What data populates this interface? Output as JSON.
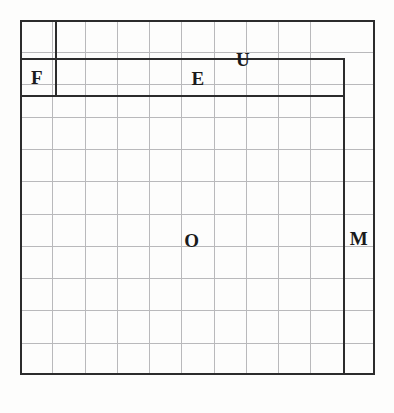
{
  "figure": {
    "type": "nested-region-grid-diagram",
    "background_color": "#fdfdfc",
    "ink_color": "#2c2c2c",
    "grid_color": "#b9b9bb",
    "frame": {
      "x": 20,
      "y": 20,
      "width": 355,
      "height": 355
    },
    "grid": {
      "columns": 11,
      "rows": 11,
      "cell_width": 32.3,
      "cell_height": 32.3
    }
  },
  "regions": [
    {
      "id": "U",
      "label": "U",
      "description": "outer top band spanning full width of frame",
      "label_x": 223,
      "label_y": 39,
      "bounds": {
        "left": 0,
        "top": 0,
        "right": 355,
        "bottom": 38
      }
    },
    {
      "id": "F",
      "label": "F",
      "description": "small left corner cell below U band",
      "label_x": 33,
      "label_y": 74,
      "bounds": {
        "left": 0,
        "top": 38,
        "right": 35,
        "bottom": 75
      }
    },
    {
      "id": "E",
      "label": "E",
      "description": "inner top band from F to M column",
      "label_x": 196,
      "label_y": 78,
      "bounds": {
        "left": 35,
        "top": 38,
        "right": 323,
        "bottom": 75
      }
    },
    {
      "id": "O",
      "label": "O",
      "description": "main interior body region",
      "label_x": 192,
      "label_y": 240,
      "bounds": {
        "left": 0,
        "top": 75,
        "right": 323,
        "bottom": 355
      }
    },
    {
      "id": "M",
      "label": "M",
      "description": "right vertical column from E band down to bottom",
      "label_x": 356,
      "label_y": 238,
      "bounds": {
        "left": 323,
        "top": 38,
        "right": 355,
        "bottom": 355
      }
    }
  ],
  "rules": {
    "vertical": [
      {
        "name": "f-right-rule",
        "x": 35,
        "y": 0,
        "height": 75
      },
      {
        "name": "m-left-rule",
        "x": 323,
        "y": 38,
        "height": 317
      }
    ],
    "horizontal": [
      {
        "name": "u-bottom-rule",
        "x": 0,
        "y": 38,
        "width": 323
      },
      {
        "name": "e-bottom-rule",
        "x": 0,
        "y": 75,
        "width": 323
      }
    ]
  },
  "grid_lines": {
    "vertical_x": [
      32,
      65,
      97,
      129,
      161,
      194,
      226,
      258,
      290,
      323
    ],
    "horizontal_y": [
      32,
      64,
      97,
      129,
      161,
      194,
      226,
      258,
      290,
      323
    ]
  }
}
